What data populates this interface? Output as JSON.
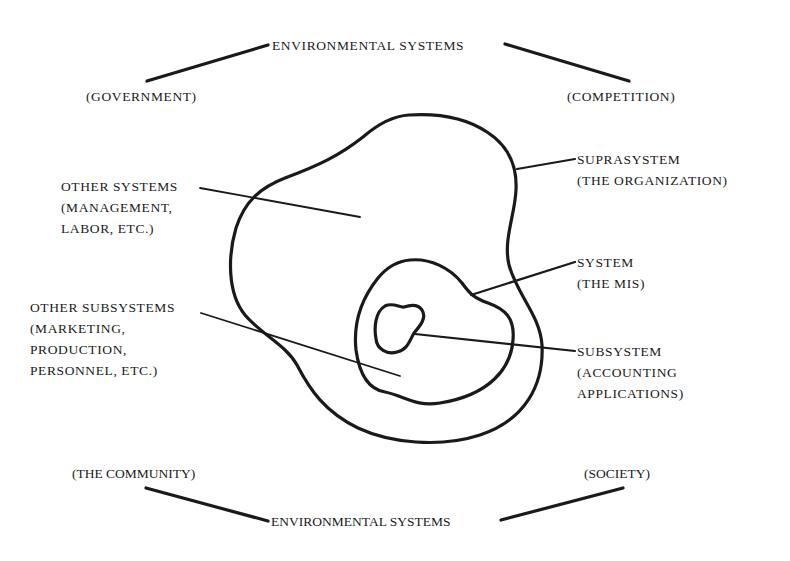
{
  "diagram": {
    "type": "nested-systems",
    "colors": {
      "ink": "#1a1a1a",
      "background": "#ffffff"
    },
    "environment": {
      "top_label": "ENVIRONMENTAL SYSTEMS",
      "bottom_label": "ENVIRONMENTAL SYSTEMS",
      "top_left": "(GOVERNMENT)",
      "top_right": "(COMPETITION)",
      "bottom_left": "(THE COMMUNITY)",
      "bottom_right": "(SOCIETY)"
    },
    "left_labels": {
      "other_systems": {
        "line1": "OTHER SYSTEMS",
        "line2": "(MANAGEMENT,",
        "line3": "LABOR, ETC.)"
      },
      "other_subsystems": {
        "line1": "OTHER SUBSYSTEMS",
        "line2": "(MARKETING,",
        "line3": "PRODUCTION,",
        "line4": "PERSONNEL, ETC.)"
      }
    },
    "right_labels": {
      "suprasystem": {
        "line1": "SUPRASYSTEM",
        "line2": "(THE ORGANIZATION)"
      },
      "system": {
        "line1": "SYSTEM",
        "line2": "(THE MIS)"
      },
      "subsystem": {
        "line1": "SUBSYSTEM",
        "line2": "(ACCOUNTING",
        "line3": "APPLICATIONS)"
      }
    },
    "nodes": [
      {
        "id": "suprasystem",
        "label": "SUPRASYSTEM (THE ORGANIZATION)",
        "contains": [
          "system"
        ]
      },
      {
        "id": "system",
        "label": "SYSTEM (THE MIS)",
        "contains": [
          "subsystem"
        ]
      },
      {
        "id": "subsystem",
        "label": "SUBSYSTEM (ACCOUNTING APPLICATIONS)"
      },
      {
        "id": "other_systems",
        "label": "OTHER SYSTEMS (MANAGEMENT, LABOR, ETC.)",
        "points_to": "inside suprasystem"
      },
      {
        "id": "other_subsystems",
        "label": "OTHER SUBSYSTEMS (MARKETING, PRODUCTION, PERSONNEL, ETC.)",
        "points_to": "inside system region"
      }
    ]
  }
}
